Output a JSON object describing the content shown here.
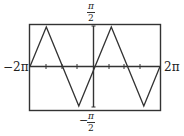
{
  "chart_data": {
    "type": "line",
    "title": "",
    "function": "arcsin(sin x)",
    "xlabel": "",
    "ylabel": "",
    "xlim": [
      -6.2832,
      6.2832
    ],
    "ylim": [
      -1.5708,
      1.5708
    ],
    "x_tick_labels": {
      "left": "−2π",
      "right": "2π"
    },
    "y_tick_labels": {
      "top_num": "π",
      "top_den": "2",
      "bottom_sign": "−",
      "bottom_num": "π",
      "bottom_den": "2"
    },
    "grid": false,
    "x": [
      -6.2832,
      -4.7124,
      -1.5708,
      1.5708,
      4.7124,
      6.2832
    ],
    "y": [
      0,
      1.5708,
      -1.5708,
      1.5708,
      -1.5708,
      0
    ],
    "x_ticks_count": 4,
    "colors": {
      "line": "#333333",
      "frame": "#333333"
    }
  }
}
